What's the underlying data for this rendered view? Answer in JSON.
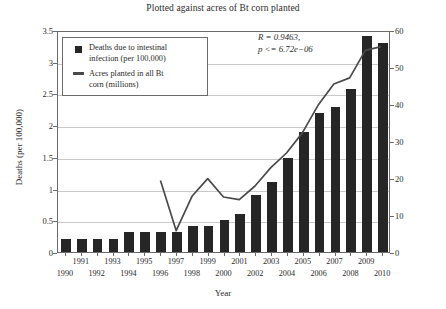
{
  "chart_data": {
    "type": "bar",
    "title": "Plotted against acres of Bt corn planted",
    "xlabel": "Year",
    "ylabel": "Deaths (per 100,000)",
    "y2label": "Acres planted (millions)",
    "categories": [
      "1990",
      "1991",
      "1992",
      "1993",
      "1994",
      "1995",
      "1996",
      "1997",
      "1998",
      "1999",
      "2000",
      "2001",
      "2002",
      "2003",
      "2004",
      "2005",
      "2006",
      "2007",
      "2008",
      "2009",
      "2010"
    ],
    "ylim": [
      0,
      3.5
    ],
    "yticks": [
      "0",
      "0.5",
      "1",
      "1.5",
      "2",
      "2.5",
      "3",
      "3.5"
    ],
    "ytick_values": [
      0,
      0.5,
      1,
      1.5,
      2,
      2.5,
      3,
      3.5
    ],
    "y2lim": [
      0,
      60
    ],
    "y2ticks": [
      "0",
      "10",
      "20",
      "30",
      "40",
      "50",
      "60"
    ],
    "y2tick_values": [
      0,
      10,
      20,
      30,
      40,
      50,
      60
    ],
    "grid": "horizontal",
    "legend_position": "top-left",
    "series": [
      {
        "name": "Deaths due to intestinal infection (per 100,000)",
        "type": "bar",
        "axis": "left",
        "color": "#262626",
        "values": [
          0.21,
          0.21,
          0.21,
          0.21,
          0.32,
          0.32,
          0.32,
          0.32,
          0.41,
          0.41,
          0.5,
          0.6,
          0.9,
          1.11,
          1.49,
          1.9,
          2.2,
          2.29,
          2.57,
          3.4,
          3.3
        ]
      },
      {
        "name": "Acres planted in all Bt corn (millions)",
        "type": "line",
        "axis": "right",
        "color": "#4a4a4a",
        "x": [
          "1996",
          "1997",
          "1998",
          "1999",
          "2000",
          "2001",
          "2002",
          "2003",
          "2004",
          "2005",
          "2006",
          "2007",
          "2008",
          "2009",
          "2010"
        ],
        "values": [
          19.5,
          5.8,
          15.2,
          20.0,
          15.0,
          14.3,
          18.0,
          23.0,
          27.0,
          32.5,
          40.0,
          45.8,
          47.5,
          55.0,
          56.0
        ]
      }
    ],
    "annotations": [
      {
        "text": "R = 0.9463,"
      },
      {
        "text": "p <= 6.72e−06"
      }
    ]
  },
  "legend": {
    "entries": [
      {
        "key": "square-marker",
        "label_line1": "Deaths due to intestinal",
        "label_line2": "infection (per 100,000)"
      },
      {
        "key": "line-marker",
        "label_line1": "Acres planted in all Bt",
        "label_line2": "corn (millions)"
      }
    ]
  }
}
